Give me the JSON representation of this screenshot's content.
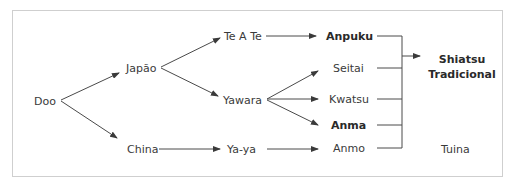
{
  "diagram": {
    "type": "genealogy-tree",
    "nodes": {
      "doo": "Doo",
      "japao": "Japão",
      "china": "China",
      "teate": "Te A Te",
      "yawara": "Yawara",
      "yaya": "Ya-ya",
      "anpuku": "Anpuku",
      "seitai": "Seitai",
      "kwatsu": "Kwatsu",
      "anma": "Anma",
      "anmo": "Anmo",
      "shiatsu_line1": "Shiatsu",
      "shiatsu_line2": "Tradicional",
      "tuina": "Tuina"
    },
    "edges": [
      {
        "from": "Doo",
        "to": "Japão"
      },
      {
        "from": "Doo",
        "to": "China"
      },
      {
        "from": "Japão",
        "to": "Te A Te"
      },
      {
        "from": "Japão",
        "to": "Yawara"
      },
      {
        "from": "China",
        "to": "Ya-ya"
      },
      {
        "from": "Te A Te",
        "to": "Anpuku"
      },
      {
        "from": "Yawara",
        "to": "Seitai"
      },
      {
        "from": "Yawara",
        "to": "Kwatsu"
      },
      {
        "from": "Yawara",
        "to": "Anma"
      },
      {
        "from": "Ya-ya",
        "to": "Anmo"
      },
      {
        "from": [
          "Anpuku",
          "Seitai",
          "Kwatsu",
          "Anma",
          "Anmo"
        ],
        "to": "Shiatsu Tradicional"
      }
    ],
    "colors": {
      "line": "#3a3a3a",
      "text": "#3a3a3a",
      "border": "#cfcfcf"
    }
  }
}
